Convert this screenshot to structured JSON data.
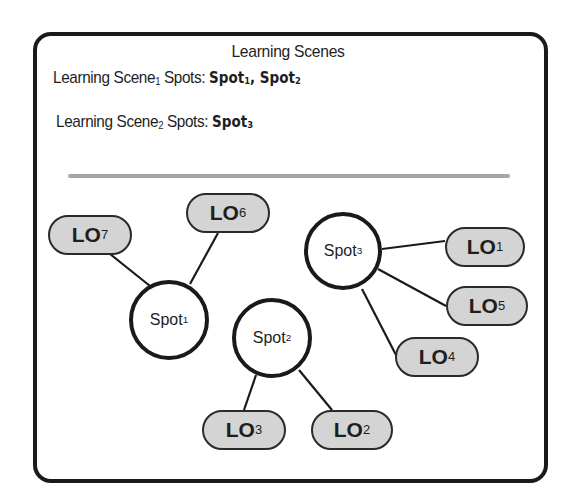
{
  "diagram": {
    "title": "Learning Scenes",
    "scenes": [
      {
        "label": "Learning Scene",
        "index": "1",
        "spots_label": "Spots:",
        "spots": [
          {
            "name": "Spot",
            "index": "1",
            "sep": ", "
          },
          {
            "name": "Spot",
            "index": "2",
            "sep": ""
          }
        ]
      },
      {
        "label": "Learning Scene",
        "index": "2",
        "spots_label": "Spots:",
        "spots": [
          {
            "name": "Spot",
            "index": "3",
            "sep": ""
          }
        ]
      }
    ],
    "spots": [
      {
        "id": "spot1",
        "name": "Spot",
        "index": "1",
        "cx": 169,
        "cy": 320,
        "r": 40
      },
      {
        "id": "spot2",
        "name": "Spot",
        "index": "2",
        "cx": 272,
        "cy": 338,
        "r": 40
      },
      {
        "id": "spot3",
        "name": "Spot",
        "index": "3",
        "cx": 343,
        "cy": 251,
        "r": 39
      }
    ],
    "learning_objects": [
      {
        "id": "lo1",
        "name": "LO",
        "index": "1",
        "x": 445,
        "y": 227,
        "w": 80,
        "h": 40,
        "spot": "spot3"
      },
      {
        "id": "lo2",
        "name": "LO",
        "index": "2",
        "x": 311,
        "y": 410,
        "w": 82,
        "h": 40,
        "spot": "spot2"
      },
      {
        "id": "lo3",
        "name": "LO",
        "index": "3",
        "x": 202,
        "y": 410,
        "w": 84,
        "h": 40,
        "spot": "spot2"
      },
      {
        "id": "lo4",
        "name": "LO",
        "index": "4",
        "x": 395,
        "y": 337,
        "w": 84,
        "h": 40,
        "spot": "spot3"
      },
      {
        "id": "lo5",
        "name": "LO",
        "index": "5",
        "x": 446,
        "y": 286,
        "w": 82,
        "h": 40,
        "spot": "spot3"
      },
      {
        "id": "lo6",
        "name": "LO",
        "index": "6",
        "x": 186,
        "y": 193,
        "w": 84,
        "h": 40,
        "spot": "spot1"
      },
      {
        "id": "lo7",
        "name": "LO",
        "index": "7",
        "x": 48,
        "y": 215,
        "w": 84,
        "h": 40,
        "spot": "spot1"
      }
    ],
    "edges": [
      {
        "from": "spot1",
        "to": "lo7",
        "x1": 150,
        "y1": 286,
        "x2": 110,
        "y2": 254
      },
      {
        "from": "spot1",
        "to": "lo6",
        "x1": 190,
        "y1": 284,
        "x2": 218,
        "y2": 233
      },
      {
        "from": "spot3",
        "to": "lo1",
        "x1": 382,
        "y1": 249,
        "x2": 445,
        "y2": 241
      },
      {
        "from": "spot3",
        "to": "lo5",
        "x1": 378,
        "y1": 269,
        "x2": 446,
        "y2": 306
      },
      {
        "from": "spot3",
        "to": "lo4",
        "x1": 362,
        "y1": 289,
        "x2": 396,
        "y2": 355
      },
      {
        "from": "spot2",
        "to": "lo3",
        "x1": 256,
        "y1": 375,
        "x2": 244,
        "y2": 410
      },
      {
        "from": "spot2",
        "to": "lo2",
        "x1": 299,
        "y1": 370,
        "x2": 332,
        "y2": 410
      }
    ],
    "colors": {
      "border": "#1a1a1a",
      "lo_fill": "#d4d4d4",
      "spot_fill": "#ffffff",
      "separator": "#a6a6a6"
    }
  }
}
